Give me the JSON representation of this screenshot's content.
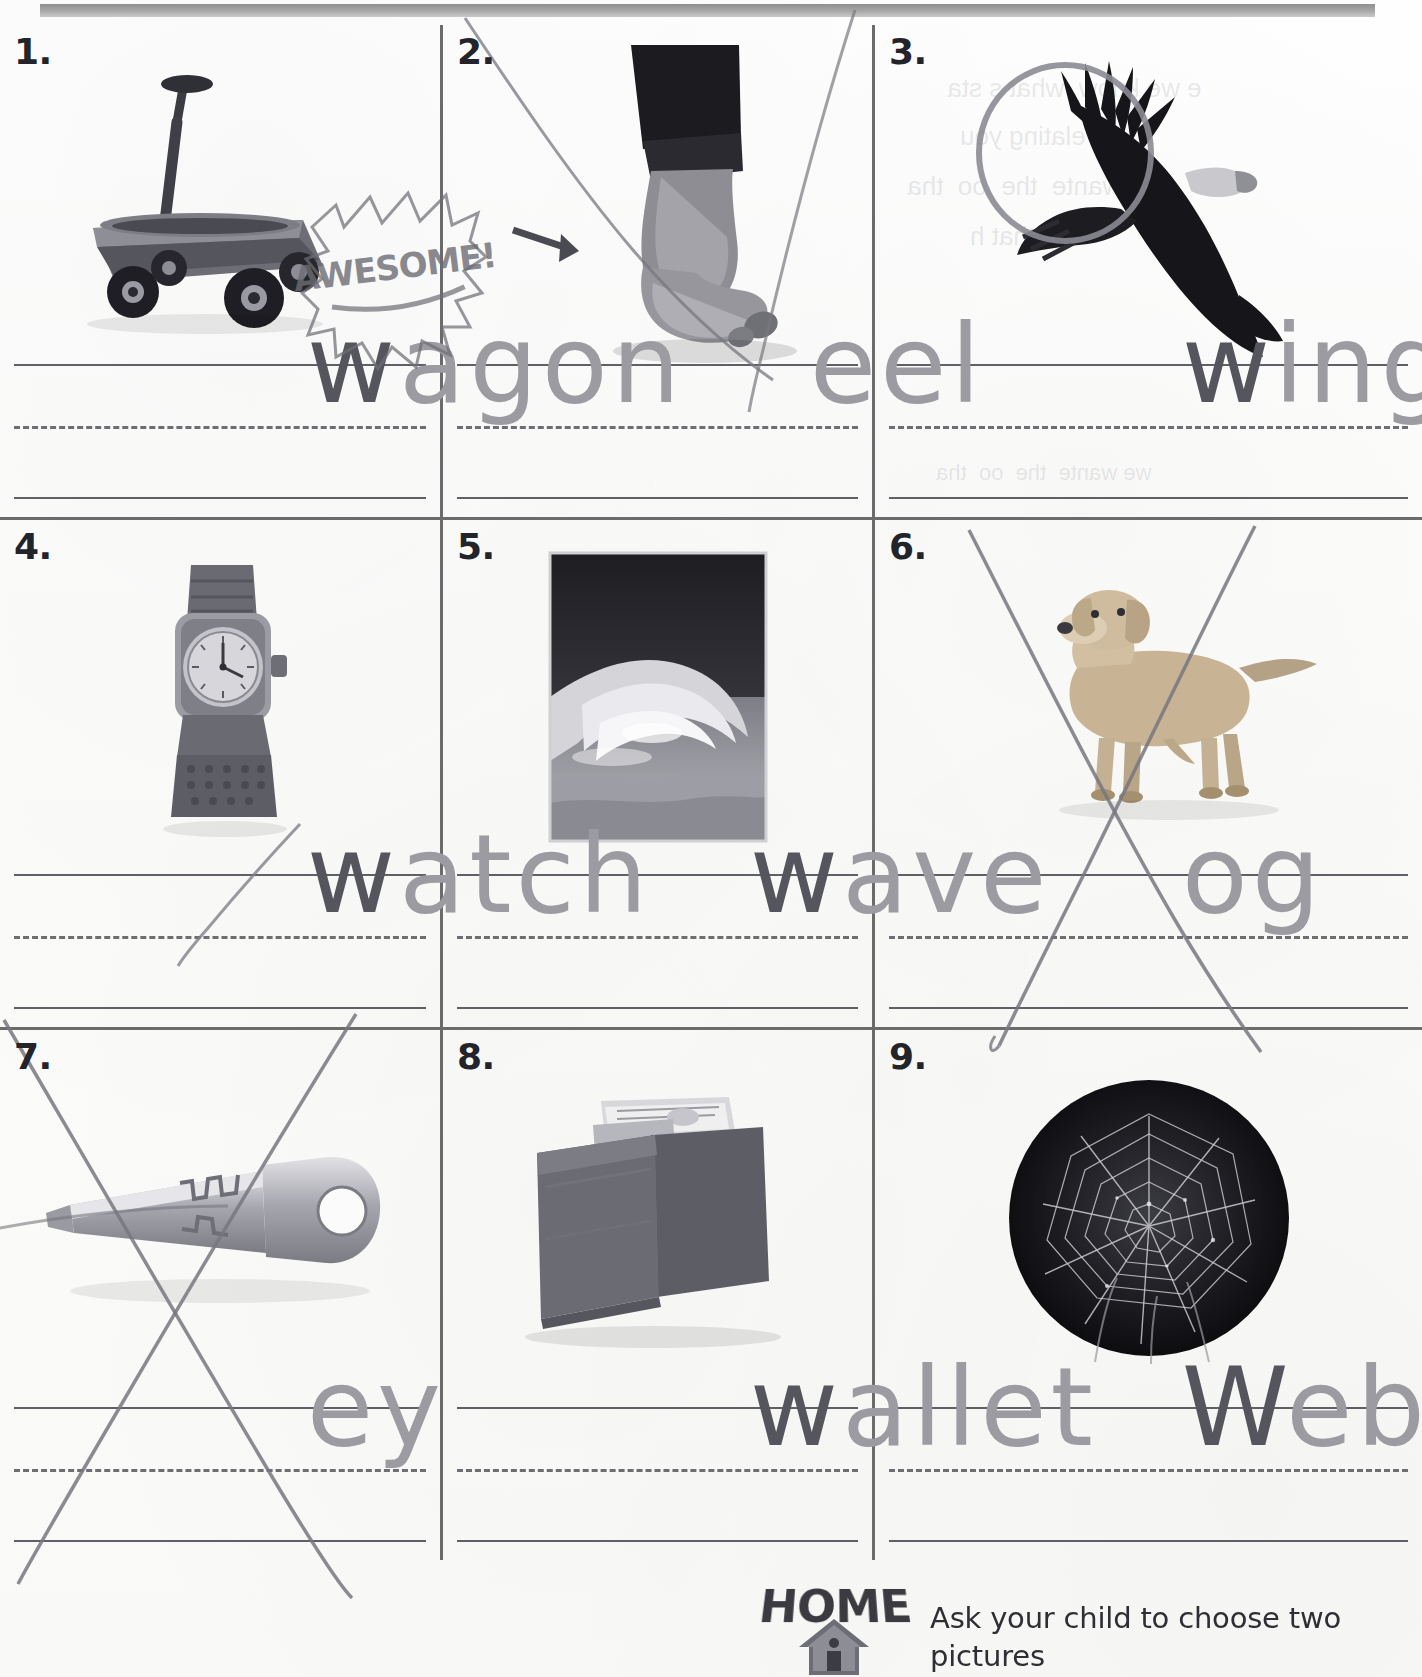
{
  "worksheet": {
    "title_bar": "",
    "cells": [
      {
        "number": "1.",
        "picture_name": "wagon-photo",
        "picture_alt": "red toy wagon with black wheels and long handle",
        "traced_word": "agon",
        "written_letter": "w",
        "full_word": "wagon",
        "marks": [
          "awesome-sticker"
        ]
      },
      {
        "number": "2.",
        "picture_name": "heel-photo",
        "picture_alt": "bare foot and lower leg showing the heel",
        "traced_word": "eel",
        "written_letter": "",
        "full_word": "heel",
        "marks": [
          "pencil-arrow",
          "pencil-curve"
        ]
      },
      {
        "number": "3.",
        "picture_name": "eagle-wing-photo",
        "picture_alt": "bald eagle in flight with wing circled",
        "traced_word": "ing",
        "written_letter": "w",
        "full_word": "wing",
        "marks": [
          "circle-around-wing"
        ]
      },
      {
        "number": "4.",
        "picture_name": "watch-photo",
        "picture_alt": "wristwatch with metal band",
        "traced_word": "atch",
        "written_letter": "w",
        "full_word": "watch",
        "marks": [
          "pencil-stroke"
        ]
      },
      {
        "number": "5.",
        "picture_name": "wave-photo",
        "picture_alt": "breaking ocean wave photograph",
        "traced_word": "ave",
        "written_letter": "w",
        "full_word": "wave",
        "marks": []
      },
      {
        "number": "6.",
        "picture_name": "dog-photo",
        "picture_alt": "golden retriever dog standing",
        "traced_word": "og",
        "written_letter": "",
        "full_word": "dog",
        "marks": [
          "large-x-cross"
        ]
      },
      {
        "number": "7.",
        "picture_name": "key-photo",
        "picture_alt": "silver metal house key",
        "traced_word": "ey",
        "written_letter": "",
        "full_word": "key",
        "marks": [
          "large-x-cross"
        ]
      },
      {
        "number": "8.",
        "picture_name": "wallet-photo",
        "picture_alt": "folded leather bifold wallet with bills",
        "traced_word": "allet",
        "written_letter": "w",
        "full_word": "wallet",
        "marks": []
      },
      {
        "number": "9.",
        "picture_name": "spiderweb-photo",
        "picture_alt": "spider web in a dark circular vignette",
        "traced_word": "eb",
        "written_letter": "W",
        "full_word": "web",
        "marks": []
      }
    ]
  },
  "footer": {
    "logo_text": "HOME",
    "logo_icon": "house-icon",
    "note": "Ask your child to choose two pictures"
  },
  "ghost_text": {
    "line1": "e we know  what s sta ",
    "line2": "s relating you",
    "line3": "we wante  the  oo  tha ",
    "line4": "a  that h"
  },
  "colors": {
    "rule_line": "#5f5f66",
    "cell_border": "#6b6b6b",
    "traced_gray": "#a7a7ad",
    "pencil": "#55555d",
    "top_bar": "#a9a9a9",
    "paper": "#fdfdfc"
  }
}
